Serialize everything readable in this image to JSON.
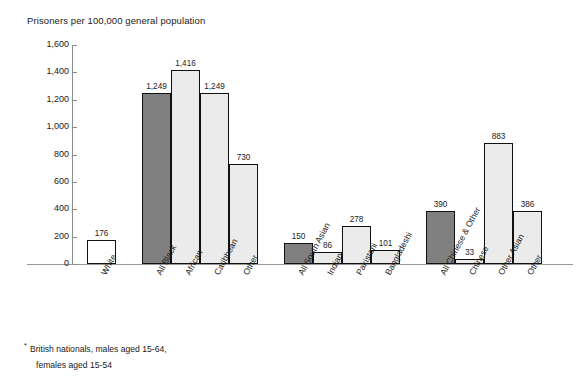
{
  "chart_data": {
    "type": "bar",
    "title": "Prisoners per 100,000 general population",
    "xlabel": "",
    "ylabel": "",
    "ylim": [
      0,
      1600
    ],
    "yticks": [
      0,
      200,
      400,
      600,
      800,
      1000,
      1200,
      1400,
      1600
    ],
    "ytick_labels": [
      "0",
      "200",
      "400",
      "600",
      "800",
      "1,000",
      "1,200",
      "1,400",
      "1,600"
    ],
    "grid": false,
    "legend": "none",
    "categories": [
      "White",
      "All Black",
      "African",
      "Caribbean",
      "Other",
      "All South Asian",
      "Indian",
      "Pakistani",
      "Bangladeshi",
      "All Chinese & Other",
      "Chinese",
      "Other Asian",
      "Other"
    ],
    "values": [
      176,
      1249,
      1416,
      1249,
      730,
      150,
      86,
      278,
      101,
      390,
      33,
      883,
      386
    ],
    "value_labels": [
      "176",
      "1,249",
      "1,416",
      "1,249",
      "730",
      "150",
      "86",
      "278",
      "101",
      "390",
      "33",
      "883",
      "386"
    ],
    "bar_styles": [
      "plain",
      "dark",
      "light",
      "light",
      "light",
      "dark",
      "light",
      "light",
      "light",
      "dark",
      "light",
      "light",
      "light"
    ],
    "groups": [
      {
        "name": "White",
        "members": [
          "White"
        ]
      },
      {
        "name": "Black",
        "members": [
          "All Black",
          "African",
          "Caribbean",
          "Other"
        ]
      },
      {
        "name": "South Asian",
        "members": [
          "All South Asian",
          "Indian",
          "Pakistani",
          "Bangladeshi"
        ]
      },
      {
        "name": "Chinese & Other",
        "members": [
          "All Chinese & Other",
          "Chinese",
          "Other Asian",
          "Other"
        ]
      }
    ],
    "colors": {
      "aggregate_bar": "#808080",
      "subgroup_bar": "#ebebeb",
      "single_bar": "#ffffff",
      "bar_outline": "#111111",
      "axis": "#8c8c8c",
      "text": "#1a1a1a"
    }
  },
  "footnote": {
    "marker": "*",
    "line1": "British nationals, males aged 15-64,",
    "line2": "females aged 15-54"
  }
}
